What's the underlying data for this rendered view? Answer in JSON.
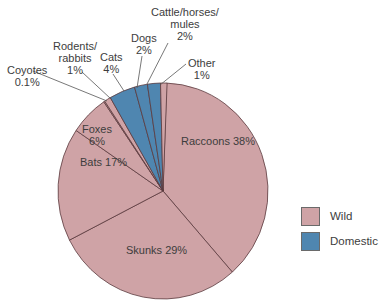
{
  "chart_data": {
    "type": "pie",
    "title": "",
    "categories": [
      "Raccoons",
      "Skunks",
      "Bats",
      "Foxes",
      "Coyotes",
      "Rodents/rabbits",
      "Cats",
      "Dogs",
      "Cattle/horses/mules",
      "Other"
    ],
    "values": [
      38,
      29,
      17,
      6,
      0.1,
      1,
      4,
      2,
      2,
      1
    ],
    "units": "%",
    "groups": [
      "Wild",
      "Wild",
      "Wild",
      "Wild",
      "Wild",
      "Wild",
      "Domestic",
      "Domestic",
      "Domestic",
      "Wild"
    ],
    "legend": [
      {
        "label": "Wild",
        "color": "#cfa3a6"
      },
      {
        "label": "Domestic",
        "color": "#4f86b0"
      }
    ],
    "legend_position": "right"
  },
  "labels": {
    "raccoons": "Raccoons 38%",
    "skunks": "Skunks 29%",
    "bats": "Bats 17%",
    "foxes_name": "Foxes",
    "foxes_pct": "6%",
    "coyotes_name": "Coyotes",
    "coyotes_pct": "0.1%",
    "rodents_name1": "Rodents/",
    "rodents_name2": "rabbits",
    "rodents_pct": "1%",
    "cats_name": "Cats",
    "cats_pct": "4%",
    "dogs_name": "Dogs",
    "dogs_pct": "2%",
    "cattle_name1": "Cattle/horses/",
    "cattle_name2": "mules",
    "cattle_pct": "2%",
    "other_name": "Other",
    "other_pct": "1%"
  },
  "legend": {
    "wild": "Wild",
    "domestic": "Domestic"
  },
  "colors": {
    "wild": "#cfa3a6",
    "domestic": "#4f86b0",
    "edge": "#5a3a3e"
  }
}
